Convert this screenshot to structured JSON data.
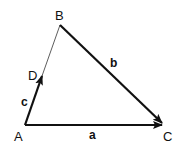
{
  "diagram": {
    "type": "vector-triangle",
    "points": {
      "A": {
        "label": "A",
        "x": 25,
        "y": 125
      },
      "B": {
        "label": "B",
        "x": 60,
        "y": 25
      },
      "C": {
        "label": "C",
        "x": 162,
        "y": 125
      },
      "D": {
        "label": "D",
        "x": 42,
        "y": 76
      }
    },
    "vectors": {
      "a": {
        "label": "a",
        "from": "A",
        "to": "C"
      },
      "b": {
        "label": "b",
        "from": "B",
        "to": "C"
      },
      "c": {
        "label": "c",
        "from": "A",
        "to": "D"
      }
    },
    "thin_segment": {
      "from": "D",
      "to": "B"
    },
    "colors": {
      "stroke": "#111111",
      "background": "#ffffff"
    }
  }
}
